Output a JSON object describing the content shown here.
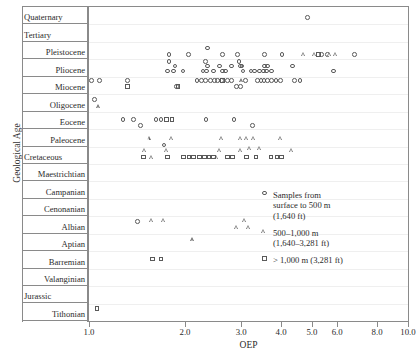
{
  "axes": {
    "y_title": "Geological Age",
    "x_title": "OEP",
    "x_ticks": [
      {
        "label": "1.0",
        "value": 1.0
      },
      {
        "label": "2.0",
        "value": 2.0
      },
      {
        "label": "3.0",
        "value": 3.0
      },
      {
        "label": "4.0",
        "value": 4.0
      },
      {
        "label": "5.0",
        "value": 5.0
      },
      {
        "label": "6.0",
        "value": 6.0
      },
      {
        "label": "8.0",
        "value": 8.0
      },
      {
        "label": "10.0",
        "value": 10.0
      }
    ]
  },
  "age_rows": [
    {
      "label": "Quaternary",
      "align": "left"
    },
    {
      "label": "Tertiary",
      "align": "left"
    },
    {
      "label": "Pleistocene",
      "align": "right"
    },
    {
      "label": "Pliocene",
      "align": "right"
    },
    {
      "label": "Miocene",
      "align": "right"
    },
    {
      "label": "Oligocene",
      "align": "right"
    },
    {
      "label": "Eocene",
      "align": "right"
    },
    {
      "label": "Paleocene",
      "align": "right"
    },
    {
      "label": "Cretaceous",
      "align": "left"
    },
    {
      "label": "Maestrichtian",
      "align": "right"
    },
    {
      "label": "Campanian",
      "align": "right"
    },
    {
      "label": "Cenonanian",
      "align": "right"
    },
    {
      "label": "Albian",
      "align": "right"
    },
    {
      "label": "Aptian",
      "align": "right"
    },
    {
      "label": "Barremian",
      "align": "right"
    },
    {
      "label": "Valanginian",
      "align": "right"
    },
    {
      "label": "Jurassic",
      "align": "left"
    },
    {
      "label": "Tithonian",
      "align": "right"
    }
  ],
  "legend": {
    "position": "inside-right",
    "items": [
      {
        "marker": "circle",
        "label": "Samples from\nsurface to 500 m\n(1,640 ft)"
      },
      {
        "marker": "triangle",
        "label": "500–1,000 m\n(1,640–3,281 ft)"
      },
      {
        "marker": "square",
        "label": "> 1,000 m (3,281 ft)"
      }
    ]
  },
  "chart_data": {
    "type": "scatter",
    "title": "",
    "xlabel": "OEP",
    "ylabel": "Geological Age",
    "x_scale": "log",
    "xlim": [
      1.0,
      10.0
    ],
    "grid": false,
    "legend_position": "inside-right",
    "y_categories": [
      "Quaternary",
      "Tertiary",
      "Pleistocene",
      "Pliocene",
      "Miocene",
      "Oligocene",
      "Eocene",
      "Paleocene",
      "Cretaceous",
      "Maestrichtian",
      "Campanian",
      "Cenonanian",
      "Albian",
      "Aptian",
      "Barremian",
      "Valanginian",
      "Jurassic",
      "Tithonian"
    ],
    "series": [
      {
        "name": "Samples from surface to 500 m (1,640 ft)",
        "marker": "circle",
        "points": [
          {
            "age": "Quaternary",
            "sub": 0.6,
            "oep": 4.85
          },
          {
            "age": "Pleistocene",
            "sub": 0.35,
            "oep": 2.35
          },
          {
            "age": "Pleistocene",
            "sub": 0.72,
            "oep": 1.78
          },
          {
            "age": "Pleistocene",
            "sub": 0.72,
            "oep": 2.05
          },
          {
            "age": "Pleistocene",
            "sub": 0.72,
            "oep": 2.62
          },
          {
            "age": "Pleistocene",
            "sub": 0.72,
            "oep": 2.92
          },
          {
            "age": "Pleistocene",
            "sub": 0.72,
            "oep": 3.55
          },
          {
            "age": "Pleistocene",
            "sub": 0.72,
            "oep": 4.03
          },
          {
            "age": "Pleistocene",
            "sub": 0.72,
            "oep": 5.35
          },
          {
            "age": "Pleistocene",
            "sub": 0.72,
            "oep": 5.6
          },
          {
            "age": "Pleistocene",
            "sub": 0.72,
            "oep": 6.8
          },
          {
            "age": "Pliocene",
            "sub": 0.12,
            "oep": 1.78
          },
          {
            "age": "Pliocene",
            "sub": 0.12,
            "oep": 2.32
          },
          {
            "age": "Pliocene",
            "sub": 0.12,
            "oep": 2.95
          },
          {
            "age": "Pliocene",
            "sub": 0.38,
            "oep": 1.86
          },
          {
            "age": "Pliocene",
            "sub": 0.38,
            "oep": 2.35
          },
          {
            "age": "Pliocene",
            "sub": 0.38,
            "oep": 2.56
          },
          {
            "age": "Pliocene",
            "sub": 0.38,
            "oep": 2.8
          },
          {
            "age": "Pliocene",
            "sub": 0.38,
            "oep": 2.98
          },
          {
            "age": "Pliocene",
            "sub": 0.38,
            "oep": 3.02
          },
          {
            "age": "Pliocene",
            "sub": 0.38,
            "oep": 3.55
          },
          {
            "age": "Pliocene",
            "sub": 0.38,
            "oep": 3.62
          },
          {
            "age": "Pliocene",
            "sub": 0.38,
            "oep": 4.35
          },
          {
            "age": "Pliocene",
            "sub": 0.66,
            "oep": 1.76
          },
          {
            "age": "Pliocene",
            "sub": 0.66,
            "oep": 1.84
          },
          {
            "age": "Pliocene",
            "sub": 0.66,
            "oep": 1.97
          },
          {
            "age": "Pliocene",
            "sub": 0.66,
            "oep": 2.28
          },
          {
            "age": "Pliocene",
            "sub": 0.66,
            "oep": 2.34
          },
          {
            "age": "Pliocene",
            "sub": 0.66,
            "oep": 2.46
          },
          {
            "age": "Pliocene",
            "sub": 0.66,
            "oep": 2.62
          },
          {
            "age": "Pliocene",
            "sub": 0.66,
            "oep": 2.68
          },
          {
            "age": "Pliocene",
            "sub": 0.66,
            "oep": 3.04
          },
          {
            "age": "Pliocene",
            "sub": 0.66,
            "oep": 3.22
          },
          {
            "age": "Pliocene",
            "sub": 0.66,
            "oep": 3.3
          },
          {
            "age": "Pliocene",
            "sub": 0.66,
            "oep": 3.42
          },
          {
            "age": "Pliocene",
            "sub": 0.66,
            "oep": 3.52
          },
          {
            "age": "Pliocene",
            "sub": 0.66,
            "oep": 3.6
          },
          {
            "age": "Pliocene",
            "sub": 0.66,
            "oep": 3.74
          },
          {
            "age": "Pliocene",
            "sub": 0.66,
            "oep": 5.85
          },
          {
            "age": "Miocene",
            "sub": 0.22,
            "oep": 1.02
          },
          {
            "age": "Miocene",
            "sub": 0.22,
            "oep": 1.08
          },
          {
            "age": "Miocene",
            "sub": 0.22,
            "oep": 1.32
          },
          {
            "age": "Miocene",
            "sub": 0.22,
            "oep": 2.18
          },
          {
            "age": "Miocene",
            "sub": 0.22,
            "oep": 2.25
          },
          {
            "age": "Miocene",
            "sub": 0.22,
            "oep": 2.32
          },
          {
            "age": "Miocene",
            "sub": 0.22,
            "oep": 2.4
          },
          {
            "age": "Miocene",
            "sub": 0.22,
            "oep": 2.47
          },
          {
            "age": "Miocene",
            "sub": 0.22,
            "oep": 2.53
          },
          {
            "age": "Miocene",
            "sub": 0.22,
            "oep": 2.6
          },
          {
            "age": "Miocene",
            "sub": 0.22,
            "oep": 2.72
          },
          {
            "age": "Miocene",
            "sub": 0.22,
            "oep": 2.8
          },
          {
            "age": "Miocene",
            "sub": 0.22,
            "oep": 3.1
          },
          {
            "age": "Miocene",
            "sub": 0.22,
            "oep": 3.38
          },
          {
            "age": "Miocene",
            "sub": 0.22,
            "oep": 3.46
          },
          {
            "age": "Miocene",
            "sub": 0.22,
            "oep": 3.54
          },
          {
            "age": "Miocene",
            "sub": 0.22,
            "oep": 3.62
          },
          {
            "age": "Miocene",
            "sub": 0.22,
            "oep": 3.74
          },
          {
            "age": "Miocene",
            "sub": 0.22,
            "oep": 3.86
          },
          {
            "age": "Miocene",
            "sub": 0.22,
            "oep": 3.98
          },
          {
            "age": "Miocene",
            "sub": 0.22,
            "oep": 4.4
          },
          {
            "age": "Miocene",
            "sub": 0.22,
            "oep": 4.58
          },
          {
            "age": "Miocene",
            "sub": 0.55,
            "oep": 1.88
          },
          {
            "age": "Miocene",
            "sub": 0.55,
            "oep": 2.9
          },
          {
            "age": "Miocene",
            "sub": 0.55,
            "oep": 2.98
          },
          {
            "age": "Oligocene",
            "sub": 0.3,
            "oep": 1.04
          },
          {
            "age": "Eocene",
            "sub": 0.45,
            "oep": 1.28
          },
          {
            "age": "Eocene",
            "sub": 0.45,
            "oep": 1.38
          },
          {
            "age": "Eocene",
            "sub": 0.45,
            "oep": 1.62
          },
          {
            "age": "Eocene",
            "sub": 0.45,
            "oep": 1.68
          },
          {
            "age": "Eocene",
            "sub": 0.45,
            "oep": 2.33
          },
          {
            "age": "Eocene",
            "sub": 0.45,
            "oep": 2.85
          },
          {
            "age": "Eocene",
            "sub": 0.78,
            "oep": 1.45
          },
          {
            "age": "Eocene",
            "sub": 0.78,
            "oep": 3.25
          },
          {
            "age": "Paleocene",
            "sub": 0.9,
            "oep": 1.72
          },
          {
            "age": "Albian",
            "sub": 0.3,
            "oep": 1.42
          }
        ]
      },
      {
        "name": "500–1,000 m (1,640–3,281 ft)",
        "marker": "triangle",
        "points": [
          {
            "age": "Pleistocene",
            "sub": 0.72,
            "oep": 4.72
          },
          {
            "age": "Pleistocene",
            "sub": 0.72,
            "oep": 5.12
          },
          {
            "age": "Pleistocene",
            "sub": 0.72,
            "oep": 5.72
          },
          {
            "age": "Pleistocene",
            "sub": 0.72,
            "oep": 5.95
          },
          {
            "age": "Miocene",
            "sub": 0.22,
            "oep": 3.02
          },
          {
            "age": "Oligocene",
            "sub": 0.72,
            "oep": 1.08
          },
          {
            "age": "Paleocene",
            "sub": 0.52,
            "oep": 1.55
          },
          {
            "age": "Paleocene",
            "sub": 0.52,
            "oep": 1.82
          },
          {
            "age": "Paleocene",
            "sub": 0.52,
            "oep": 2.62
          },
          {
            "age": "Paleocene",
            "sub": 0.52,
            "oep": 3.0
          },
          {
            "age": "Paleocene",
            "sub": 0.52,
            "oep": 3.14
          },
          {
            "age": "Paleocene",
            "sub": 0.52,
            "oep": 3.3
          },
          {
            "age": "Paleocene",
            "sub": 0.52,
            "oep": 4.0
          },
          {
            "age": "Cretaceous",
            "sub": 0.22,
            "oep": 1.5
          },
          {
            "age": "Cretaceous",
            "sub": 0.22,
            "oep": 1.76
          },
          {
            "age": "Cretaceous",
            "sub": 0.22,
            "oep": 2.58
          },
          {
            "age": "Cretaceous",
            "sub": 0.22,
            "oep": 3.0
          },
          {
            "age": "Cretaceous",
            "sub": 0.1,
            "oep": 3.2
          },
          {
            "age": "Cretaceous",
            "sub": 0.1,
            "oep": 3.44
          },
          {
            "age": "Cretaceous",
            "sub": 0.22,
            "oep": 4.35
          },
          {
            "age": "Cretaceous",
            "sub": 0.6,
            "oep": 1.58
          },
          {
            "age": "Cretaceous",
            "sub": 0.6,
            "oep": 2.52
          },
          {
            "age": "Albian",
            "sub": 0.22,
            "oep": 1.58
          },
          {
            "age": "Albian",
            "sub": 0.22,
            "oep": 1.72
          },
          {
            "age": "Albian",
            "sub": 0.22,
            "oep": 3.08
          },
          {
            "age": "Albian",
            "sub": 0.62,
            "oep": 2.92
          },
          {
            "age": "Albian",
            "sub": 0.62,
            "oep": 3.18
          },
          {
            "age": "Aptian",
            "sub": 0.35,
            "oep": 2.12
          }
        ]
      },
      {
        "name": "> 1,000 m (3,281 ft)",
        "marker": "square",
        "points": [
          {
            "age": "Pleistocene",
            "sub": 0.72,
            "oep": 5.25
          },
          {
            "age": "Miocene",
            "sub": 0.22,
            "oep": 2.62
          },
          {
            "age": "Miocene",
            "sub": 0.55,
            "oep": 1.32
          },
          {
            "age": "Miocene",
            "sub": 0.55,
            "oep": 1.9
          },
          {
            "age": "Eocene",
            "sub": 0.45,
            "oep": 1.75
          },
          {
            "age": "Eocene",
            "sub": 0.45,
            "oep": 1.82
          },
          {
            "age": "Cretaceous",
            "sub": 0.6,
            "oep": 1.48
          },
          {
            "age": "Cretaceous",
            "sub": 0.6,
            "oep": 1.76
          },
          {
            "age": "Cretaceous",
            "sub": 0.6,
            "oep": 1.98
          },
          {
            "age": "Cretaceous",
            "sub": 0.6,
            "oep": 2.06
          },
          {
            "age": "Cretaceous",
            "sub": 0.6,
            "oep": 2.13
          },
          {
            "age": "Cretaceous",
            "sub": 0.6,
            "oep": 2.22
          },
          {
            "age": "Cretaceous",
            "sub": 0.6,
            "oep": 2.3
          },
          {
            "age": "Cretaceous",
            "sub": 0.6,
            "oep": 2.38
          },
          {
            "age": "Cretaceous",
            "sub": 0.6,
            "oep": 2.46
          },
          {
            "age": "Cretaceous",
            "sub": 0.6,
            "oep": 2.72
          },
          {
            "age": "Cretaceous",
            "sub": 0.6,
            "oep": 2.82
          },
          {
            "age": "Cretaceous",
            "sub": 0.6,
            "oep": 3.12
          },
          {
            "age": "Cretaceous",
            "sub": 0.6,
            "oep": 3.34
          },
          {
            "age": "Cretaceous",
            "sub": 0.6,
            "oep": 3.72
          },
          {
            "age": "Cretaceous",
            "sub": 0.6,
            "oep": 3.88
          },
          {
            "age": "Cretaceous",
            "sub": 0.6,
            "oep": 4.02
          },
          {
            "age": "Barremian",
            "sub": 0.45,
            "oep": 1.58
          },
          {
            "age": "Barremian",
            "sub": 0.45,
            "oep": 1.68
          },
          {
            "age": "Tithonian",
            "sub": 0.3,
            "oep": 1.06
          }
        ]
      }
    ]
  }
}
